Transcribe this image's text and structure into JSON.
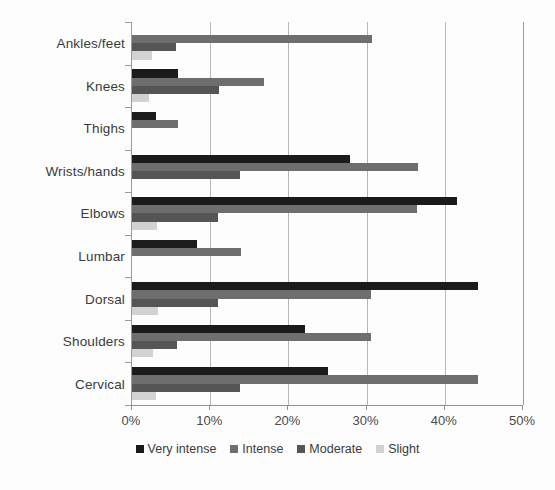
{
  "chart_data": {
    "type": "bar",
    "orientation": "horizontal",
    "title": "",
    "subtitle": "",
    "xlabel": "",
    "ylabel": "",
    "xlim": [
      0,
      50
    ],
    "xtick_labels": [
      "0%",
      "10%",
      "20%",
      "30%",
      "40%",
      "50%"
    ],
    "xtick_values": [
      0,
      10,
      20,
      30,
      40,
      50
    ],
    "grid": true,
    "grid_axis": "x",
    "legend_position": "bottom",
    "value_unit": "%",
    "categories": [
      "Ankles/feet",
      "Knees",
      "Thighs",
      "Wrists/hands",
      "Elbows",
      "Lumbar",
      "Dorsal",
      "Shoulders",
      "Cervical"
    ],
    "series": [
      {
        "name": "Very intense",
        "color": "#1b1b1b",
        "values": [
          0.0,
          5.9,
          3.1,
          27.9,
          41.6,
          8.3,
          44.3,
          22.1,
          25.1
        ]
      },
      {
        "name": "Intense",
        "color": "#6e6e6e",
        "values": [
          30.7,
          16.9,
          5.9,
          36.6,
          36.5,
          14.0,
          30.6,
          30.6,
          44.3
        ]
      },
      {
        "name": "Moderate",
        "color": "#555555",
        "values": [
          5.6,
          11.1,
          0.0,
          13.8,
          11.0,
          0.0,
          11.0,
          5.8,
          13.8
        ]
      },
      {
        "name": "Slight",
        "color": "#d2d2d2",
        "values": [
          2.6,
          2.2,
          0.0,
          0.0,
          3.2,
          0.0,
          3.3,
          2.7,
          3.1
        ]
      }
    ]
  },
  "legend": {
    "items": [
      {
        "label": "Very intense",
        "color": "#1b1b1b"
      },
      {
        "label": "Intense",
        "color": "#6e6e6e"
      },
      {
        "label": "Moderate",
        "color": "#555555"
      },
      {
        "label": "Slight",
        "color": "#d2d2d2"
      }
    ]
  }
}
